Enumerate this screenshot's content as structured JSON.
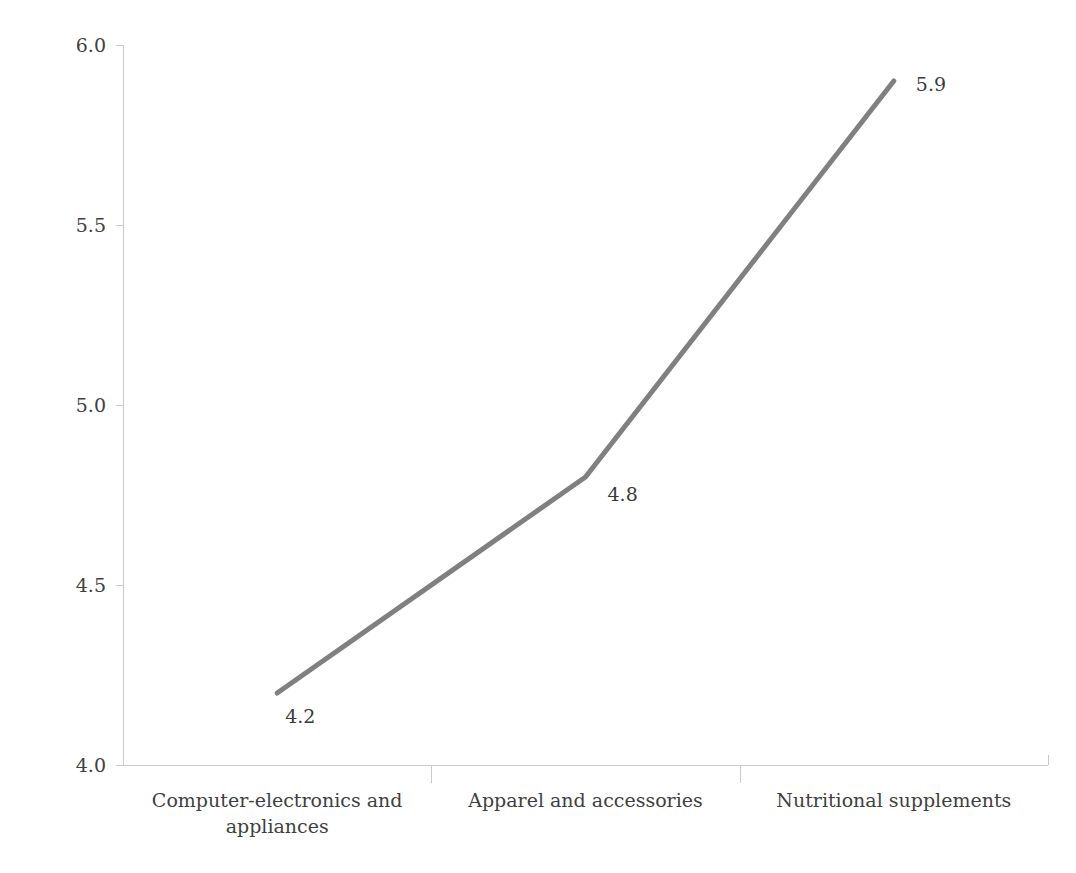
{
  "chart_data": {
    "type": "line",
    "title": "",
    "xlabel": "",
    "ylabel": "Ease to evaluate quality before consumption",
    "categories": [
      "Computer-electronics and appliances",
      "Apparel and accessories",
      "Nutritional supplements"
    ],
    "category_lines": [
      [
        "Computer-electronics and",
        "appliances"
      ],
      [
        "Apparel and accessories",
        ""
      ],
      [
        "Nutritional supplements",
        ""
      ]
    ],
    "values": [
      4.2,
      4.8,
      5.9
    ],
    "point_labels": [
      "4.2",
      "4.8",
      "5.9"
    ],
    "ylim": [
      4.0,
      6.0
    ],
    "yticks": [
      "4.0",
      "4.5",
      "5.0",
      "5.5",
      "6.0"
    ],
    "ytick_values": [
      4.0,
      4.5,
      5.0,
      5.5,
      6.0
    ],
    "grid": false,
    "legend": null,
    "series_color": "#808080",
    "axis_color": "#c9c9c9",
    "text_color": "#3f3f3f"
  },
  "axis": {
    "y_title": "Ease to evaluate quality before consumption"
  }
}
